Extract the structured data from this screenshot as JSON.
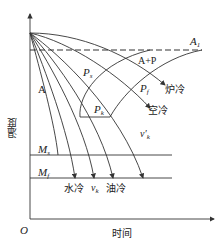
{
  "diagram": {
    "title": "",
    "axes": {
      "y_label": "温度",
      "x_label": "时间",
      "origin": "O"
    },
    "lines": {
      "A1": {
        "label": "A",
        "sub": "1",
        "style": "dashed"
      },
      "Ms": {
        "label": "M",
        "sub": "s"
      },
      "Mf": {
        "label": "M",
        "sub": "f"
      }
    },
    "regions": {
      "austenite": "A",
      "austenite_pearlite": "A+P"
    },
    "curves": {
      "Ps": {
        "label": "P",
        "sub": "s"
      },
      "Pf": {
        "label": "P",
        "sub": "f"
      },
      "Pk": {
        "label": "P",
        "sub": "k"
      }
    },
    "cooling": {
      "furnace": "炉冷",
      "air": "空冷",
      "water": "水冷",
      "critical": {
        "label": "v",
        "sub": "k"
      },
      "oil": "油冷",
      "critical_upper": {
        "label": "v′",
        "sub": "k"
      }
    }
  },
  "colors": {
    "line": "#333333",
    "background": "#ffffff"
  }
}
